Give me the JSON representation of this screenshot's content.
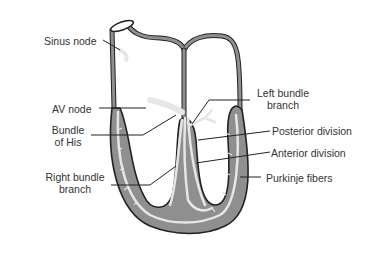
{
  "diagram": {
    "colors": {
      "muscle": "#8f8f8f",
      "outline": "#222222",
      "conduction": "#e6e6e6",
      "text": "#333333",
      "leader": "#222222"
    },
    "labels": {
      "sinus_node": "Sinus node",
      "av_node": "AV node",
      "bundle_of_his_1": "Bundle",
      "bundle_of_his_2": "of His",
      "right_bundle_1": "Right bundle",
      "right_bundle_2": "branch",
      "left_bundle_1": "Left bundle",
      "left_bundle_2": "branch",
      "posterior_division": "Posterior division",
      "anterior_division": "Anterior division",
      "purkinje_fibers": "Purkinje fibers"
    }
  }
}
